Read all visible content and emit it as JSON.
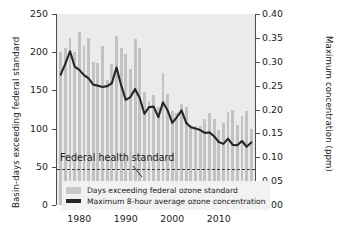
{
  "chart_data": {
    "type": "bar",
    "title": "",
    "xlabel": "",
    "ylabel": "Basin-days exceeding federal standard",
    "ylabel_right": "Maximum concentration (ppm)",
    "grid": false,
    "legend_position": "bottom-left",
    "xlim": [
      1975.2,
      2017.8
    ],
    "ylim_left": [
      0,
      250
    ],
    "ylim_right": [
      0.0,
      0.4
    ],
    "xticks": [
      1980,
      1990,
      2000,
      2010
    ],
    "xtick_labels": [
      "1980",
      "1990",
      "2000",
      "2010"
    ],
    "yticks_left": [
      0,
      50,
      100,
      150,
      200,
      250
    ],
    "ytick_labels_left": [
      "0",
      "50",
      "100",
      "150",
      "200",
      "250"
    ],
    "yticks_right": [
      0.0,
      0.05,
      0.1,
      0.15,
      0.2,
      0.25,
      0.3,
      0.35,
      0.4
    ],
    "ytick_labels_right": [
      "0.00",
      "0.05",
      "0.10",
      "0.15",
      "0.20",
      "0.25",
      "0.30",
      "0.35",
      "0.40"
    ],
    "annotation": {
      "text": "Federal health standard",
      "value_ppm": 0.075
    },
    "x": [
      1976,
      1977,
      1978,
      1979,
      1980,
      1981,
      1982,
      1983,
      1984,
      1985,
      1986,
      1987,
      1988,
      1989,
      1990,
      1991,
      1992,
      1993,
      1994,
      1995,
      1996,
      1997,
      1998,
      1999,
      2000,
      2001,
      2002,
      2003,
      2004,
      2005,
      2006,
      2007,
      2008,
      2009,
      2010,
      2011,
      2012,
      2013,
      2014,
      2015,
      2016,
      2017
    ],
    "series": [
      {
        "name": "Days exceeding federal ozone standard",
        "type": "bar",
        "axis": "left",
        "color": "#c2c2c2",
        "values": [
          200,
          205,
          219,
          200,
          227,
          208,
          219,
          187,
          186,
          208,
          163,
          185,
          221,
          205,
          198,
          178,
          217,
          206,
          148,
          136,
          144,
          128,
          173,
          145,
          123,
          121,
          132,
          128,
          105,
          104,
          103,
          112,
          121,
          113,
          98,
          108,
          122,
          124,
          105,
          116,
          123,
          99
        ]
      },
      {
        "name": "Maximum 8-hour average ozone concentration",
        "type": "line",
        "axis": "right",
        "color": "#262626",
        "values": [
          0.273,
          0.296,
          0.322,
          0.29,
          0.283,
          0.272,
          0.265,
          0.252,
          0.25,
          0.247,
          0.249,
          0.255,
          0.288,
          0.251,
          0.22,
          0.226,
          0.243,
          0.224,
          0.191,
          0.205,
          0.206,
          0.184,
          0.215,
          0.198,
          0.172,
          0.184,
          0.198,
          0.172,
          0.163,
          0.16,
          0.157,
          0.151,
          0.152,
          0.144,
          0.132,
          0.128,
          0.139,
          0.126,
          0.125,
          0.134,
          0.122,
          0.131
        ]
      }
    ]
  },
  "legend": {
    "items": [
      {
        "label": "Days exceeding federal ozone standard",
        "marker": "patch"
      },
      {
        "label": "Maximum 8-hour average ozone concentration",
        "marker": "line"
      }
    ]
  }
}
